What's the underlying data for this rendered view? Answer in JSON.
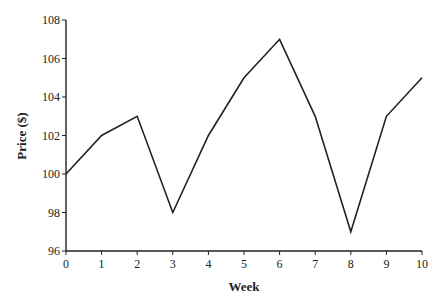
{
  "chart_data": {
    "type": "line",
    "title": "",
    "xlabel": "Week",
    "ylabel": "Price ($)",
    "x": [
      0,
      1,
      2,
      3,
      4,
      5,
      6,
      7,
      8,
      9,
      10
    ],
    "series": [
      {
        "name": "Price",
        "values": [
          100,
          102,
          103,
          98,
          102,
          105,
          107,
          103,
          97,
          103,
          105
        ]
      }
    ],
    "xlim": [
      0,
      10
    ],
    "ylim": [
      96,
      108
    ],
    "xticks": [
      0,
      1,
      2,
      3,
      4,
      5,
      6,
      7,
      8,
      9,
      10
    ],
    "yticks": [
      96,
      98,
      100,
      102,
      104,
      106,
      108
    ],
    "grid": false,
    "legend": null,
    "line_color": "#222222"
  }
}
